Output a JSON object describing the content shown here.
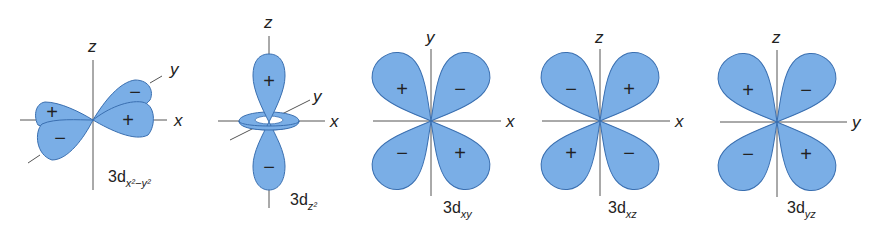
{
  "colors": {
    "lobe_fill": "#7aaee6",
    "lobe_stroke": "#3a6fb0",
    "axis": "#555555",
    "text": "#222222"
  },
  "orbitals": [
    {
      "id": "dx2-y2",
      "name_main": "3d",
      "name_sub": "x²−y²",
      "axes": {
        "vertical": "z",
        "horizontal": "x",
        "diagonal": "y"
      },
      "signs": [
        "+",
        "−",
        "−",
        "+"
      ]
    },
    {
      "id": "dz2",
      "name_main": "3d",
      "name_sub": "z²",
      "axes": {
        "vertical": "z",
        "horizontal": "x",
        "diagonal": "y"
      },
      "signs": [
        "+",
        "−"
      ]
    },
    {
      "id": "dxy",
      "name_main": "3d",
      "name_sub": "xy",
      "axes": {
        "vertical": "y",
        "horizontal": "x"
      },
      "signs": [
        "+",
        "−",
        "−",
        "+"
      ]
    },
    {
      "id": "dxz",
      "name_main": "3d",
      "name_sub": "xz",
      "axes": {
        "vertical": "z",
        "horizontal": "x"
      },
      "signs": [
        "−",
        "+",
        "+",
        "−"
      ]
    },
    {
      "id": "dyz",
      "name_main": "3d",
      "name_sub": "yz",
      "axes": {
        "vertical": "z",
        "horizontal": "y"
      },
      "signs": [
        "+",
        "−",
        "−",
        "+"
      ]
    }
  ]
}
